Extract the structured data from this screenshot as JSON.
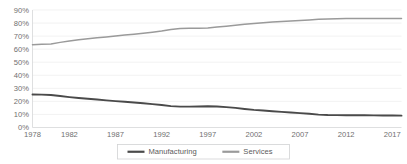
{
  "chart_data": {
    "type": "line",
    "title": "",
    "subtitle": "",
    "xlabel": "",
    "ylabel": "",
    "grid": true,
    "legend_position": "bottom",
    "ylim": [
      0,
      90
    ],
    "xlim": [
      1978,
      2018
    ],
    "ytick_labels": [
      "90%",
      "80%",
      "70%",
      "60%",
      "50%",
      "40%",
      "30%",
      "20%",
      "10%",
      "0%"
    ],
    "ytick_values": [
      90,
      80,
      70,
      60,
      50,
      40,
      30,
      20,
      10,
      0
    ],
    "xtick_labels": [
      "1978",
      "1982",
      "1987",
      "1992",
      "1997",
      "2002",
      "2007",
      "2012",
      "2017"
    ],
    "xtick_values": [
      1978,
      1982,
      1987,
      1992,
      1997,
      2002,
      2007,
      2012,
      2017
    ],
    "x": [
      1978,
      1979,
      1980,
      1981,
      1982,
      1983,
      1984,
      1985,
      1986,
      1987,
      1988,
      1989,
      1990,
      1991,
      1992,
      1993,
      1994,
      1995,
      1996,
      1997,
      1998,
      1999,
      2000,
      2001,
      2002,
      2003,
      2004,
      2005,
      2006,
      2007,
      2008,
      2009,
      2010,
      2011,
      2012,
      2013,
      2014,
      2015,
      2016,
      2017,
      2018
    ],
    "series": [
      {
        "name": "Manufacturing",
        "color": "#4a4a4a",
        "values": [
          25.3,
          25.2,
          24.9,
          24.1,
          23.3,
          22.6,
          22.0,
          21.4,
          20.8,
          20.2,
          19.7,
          19.2,
          18.6,
          17.9,
          17.2,
          16.4,
          16.0,
          16.0,
          16.1,
          16.3,
          16.1,
          15.6,
          15.0,
          14.2,
          13.5,
          13.0,
          12.5,
          12.0,
          11.5,
          11.0,
          10.5,
          9.9,
          9.6,
          9.5,
          9.4,
          9.4,
          9.4,
          9.3,
          9.2,
          9.2,
          9.1
        ]
      },
      {
        "name": "Services",
        "color": "#9a9a9a",
        "values": [
          63.4,
          63.8,
          64.0,
          65.2,
          66.3,
          67.2,
          68.0,
          68.7,
          69.4,
          70.1,
          70.8,
          71.5,
          72.2,
          73.0,
          73.9,
          75.0,
          75.8,
          76.0,
          76.1,
          76.3,
          76.9,
          77.6,
          78.3,
          79.1,
          79.7,
          80.3,
          80.8,
          81.2,
          81.6,
          82.0,
          82.4,
          82.9,
          83.1,
          83.3,
          83.4,
          83.4,
          83.4,
          83.4,
          83.5,
          83.5,
          83.5
        ]
      }
    ],
    "legend": [
      {
        "label": "Manufacturing",
        "color": "#4a4a4a"
      },
      {
        "label": "Services",
        "color": "#9a9a9a"
      }
    ]
  }
}
